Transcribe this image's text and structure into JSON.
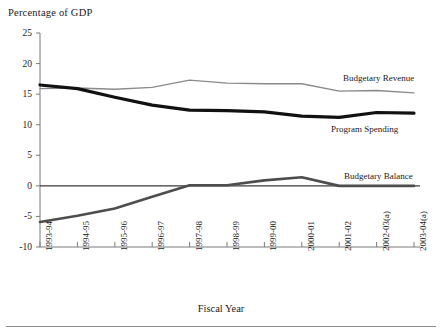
{
  "chart_data": {
    "type": "line",
    "title": "Percentage of GDP",
    "ylabel": "Percentage of GDP",
    "xlabel": "Fiscal Year",
    "ylim": [
      -10,
      25
    ],
    "yticks": [
      25,
      20,
      15,
      10,
      5,
      0,
      -5,
      -10
    ],
    "ytick_labels": [
      "25",
      "20",
      "15",
      "10",
      "5",
      "0",
      "-5",
      "-10"
    ],
    "grid": false,
    "legend_position": "inline-right",
    "zero_line": true,
    "categories": [
      "1993-94",
      "1994-95",
      "1995-96",
      "1996-97",
      "1997-98",
      "1998-99",
      "1999-00",
      "2000-01",
      "2001-02",
      "2002-03(a)",
      "2003-04(a)"
    ],
    "series": [
      {
        "name": "Budgetary Revenue",
        "color": "#8a8a8a",
        "width": 1.4,
        "values": [
          15.9,
          16.0,
          15.8,
          16.1,
          17.3,
          16.8,
          16.7,
          16.7,
          15.5,
          15.6,
          15.2
        ]
      },
      {
        "name": "Program Spending",
        "color": "#111111",
        "width": 3.2,
        "values": [
          16.5,
          15.9,
          14.5,
          13.2,
          12.4,
          12.3,
          12.1,
          11.4,
          11.2,
          12.0,
          11.9
        ]
      },
      {
        "name": "Budgetary Balance",
        "color": "#4d4d4d",
        "width": 2.6,
        "values": [
          -5.9,
          -4.9,
          -3.7,
          -1.8,
          0.1,
          0.1,
          0.9,
          1.4,
          0.0,
          0.0,
          0.0
        ]
      }
    ]
  },
  "axis": {
    "ylabel_title": "Percentage of GDP",
    "xlabel_title": "Fiscal Year"
  },
  "series_labels": [
    {
      "text": "Budgetary Revenue",
      "x": 343,
      "y": 73
    },
    {
      "text": "Program Spending",
      "x": 331,
      "y": 124
    },
    {
      "text": "Budgetary Balance",
      "x": 344,
      "y": 171
    }
  ]
}
